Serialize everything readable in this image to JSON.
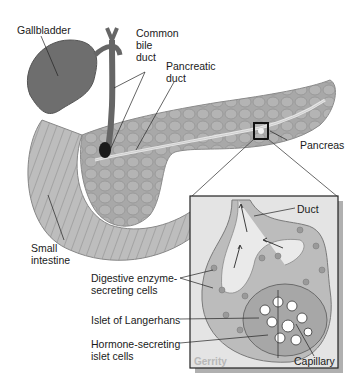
{
  "figure": {
    "labels": {
      "gallbladder": "Gallbladder",
      "common_bile_duct": [
        "Common",
        "bile",
        "duct"
      ],
      "pancreatic_duct": [
        "Pancreatic",
        "duct"
      ],
      "pancreas": "Pancreas",
      "small_intestine": [
        "Small",
        "intestine"
      ],
      "duct": "Duct",
      "digestive_enzyme_cells": [
        "Digestive enzyme-",
        "secreting cells"
      ],
      "islet_of_langerhans": "Islet of Langerhans",
      "hormone_secreting_cells": [
        "Hormone-secreting",
        "islet cells"
      ],
      "capillary": "Capillary"
    },
    "watermark": "Gerrity",
    "colors": {
      "organ_dark": "#6e6e6e",
      "organ_mid": "#a4a4a4",
      "organ_light": "#c8c8c8",
      "inset_bg": "#e4e4e4",
      "shadow": "#b0b0b0",
      "line": "#222222"
    }
  }
}
